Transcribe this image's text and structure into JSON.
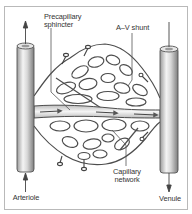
{
  "diagram": {
    "labels": {
      "precapillary_sphincter_line1": "Precapillary",
      "precapillary_sphincter_line2": "sphincter",
      "av_shunt": "A–V shunt",
      "capillary_network_line1": "Capillary",
      "capillary_network_line2": "network",
      "arteriole": "Arteriole",
      "venule": "Venule"
    },
    "nodes": [
      {
        "id": "arteriole",
        "label": "Arteriole",
        "type": "vessel",
        "flow": "up (inflow arrow from below)"
      },
      {
        "id": "venule",
        "label": "Venule",
        "type": "vessel",
        "flow": "down (outflow arrow below)"
      },
      {
        "id": "capillary-network",
        "label": "Capillary network",
        "type": "mesh"
      },
      {
        "id": "av-shunt",
        "label": "A–V shunt",
        "type": "channel"
      },
      {
        "id": "precapillary-sphincter",
        "label": "Precapillary sphincter",
        "type": "structure"
      }
    ],
    "edges": [
      {
        "from": "arteriole",
        "to": "capillary-network"
      },
      {
        "from": "arteriole",
        "to": "venule",
        "via": "thoroughfare channel"
      },
      {
        "from": "capillary-network",
        "to": "venule"
      }
    ],
    "colors": {
      "frame": "#b9b9b9",
      "stroke": "#555555",
      "vessel_light": "#f2f2f2",
      "vessel_dark": "#8a8a8a",
      "text": "#333333"
    }
  }
}
